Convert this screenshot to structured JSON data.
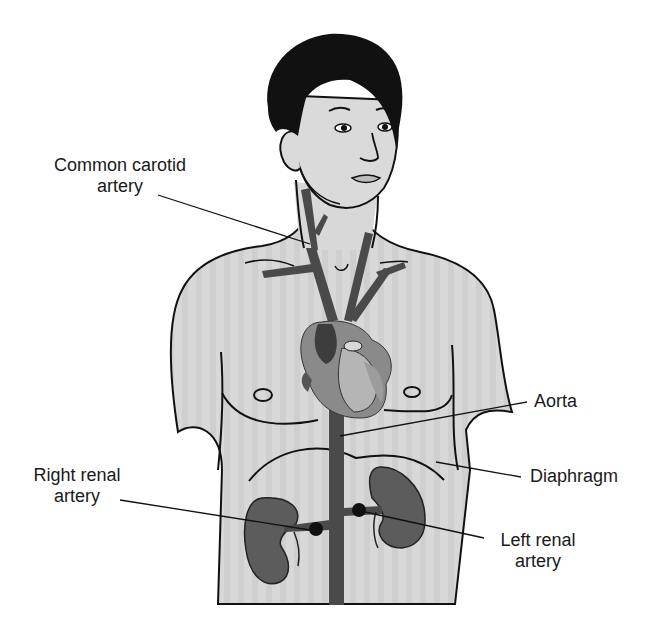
{
  "figure": {
    "colors": {
      "skin": "#d6d6d6",
      "hair": "#111111",
      "vessel": "#4a4a4a",
      "heart": "#6e6e6e",
      "heart_light": "#a9a9a9",
      "kidney": "#5c5c5c",
      "outline": "#111111",
      "leader_line": "#111111",
      "text": "#1a1a1a"
    }
  },
  "labels": {
    "common_carotid": {
      "line1": "Common carotid",
      "line2": "artery"
    },
    "aorta": {
      "line1": "Aorta"
    },
    "diaphragm": {
      "line1": "Diaphragm"
    },
    "right_renal": {
      "line1": "Right renal",
      "line2": "artery"
    },
    "left_renal": {
      "line1": "Left renal",
      "line2": "artery"
    }
  }
}
